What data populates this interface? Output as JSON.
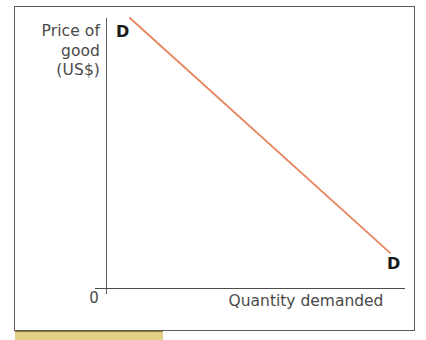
{
  "figure": {
    "kind": "demand-curve-diagram",
    "background_color": "#ffffff",
    "frame_color": "#5c5c5c",
    "axis_color": "#4c4c4c",
    "text_color": "#4a4a4a",
    "curve_color": "#e8845e",
    "swatch_color": "#e3cf86"
  },
  "axes": {
    "y_label_lines": [
      "Price of",
      "good",
      "(US$)"
    ],
    "x_label": "Quantity demanded",
    "origin_label": "0"
  },
  "curve": {
    "top_label": "D",
    "bottom_label": "D"
  },
  "chart_data": {
    "type": "line",
    "title": "",
    "subtitle": "",
    "xlabel": "Quantity demanded",
    "ylabel": "Price of good (US$)",
    "xlim": [
      0,
      100
    ],
    "ylim": [
      0,
      100
    ],
    "grid": false,
    "legend": null,
    "axis_tick_labels": {
      "x": [
        "0"
      ],
      "y": []
    },
    "annotations": [
      {
        "text": "D",
        "x": 8,
        "y": 100,
        "position": "curve-upper-left"
      },
      {
        "text": "D",
        "x": 95,
        "y": 13,
        "position": "curve-lower-right"
      }
    ],
    "series": [
      {
        "name": "D",
        "label": "Demand",
        "color": "#e8845e",
        "x": [
          8,
          95
        ],
        "values": [
          100,
          13
        ]
      }
    ]
  }
}
